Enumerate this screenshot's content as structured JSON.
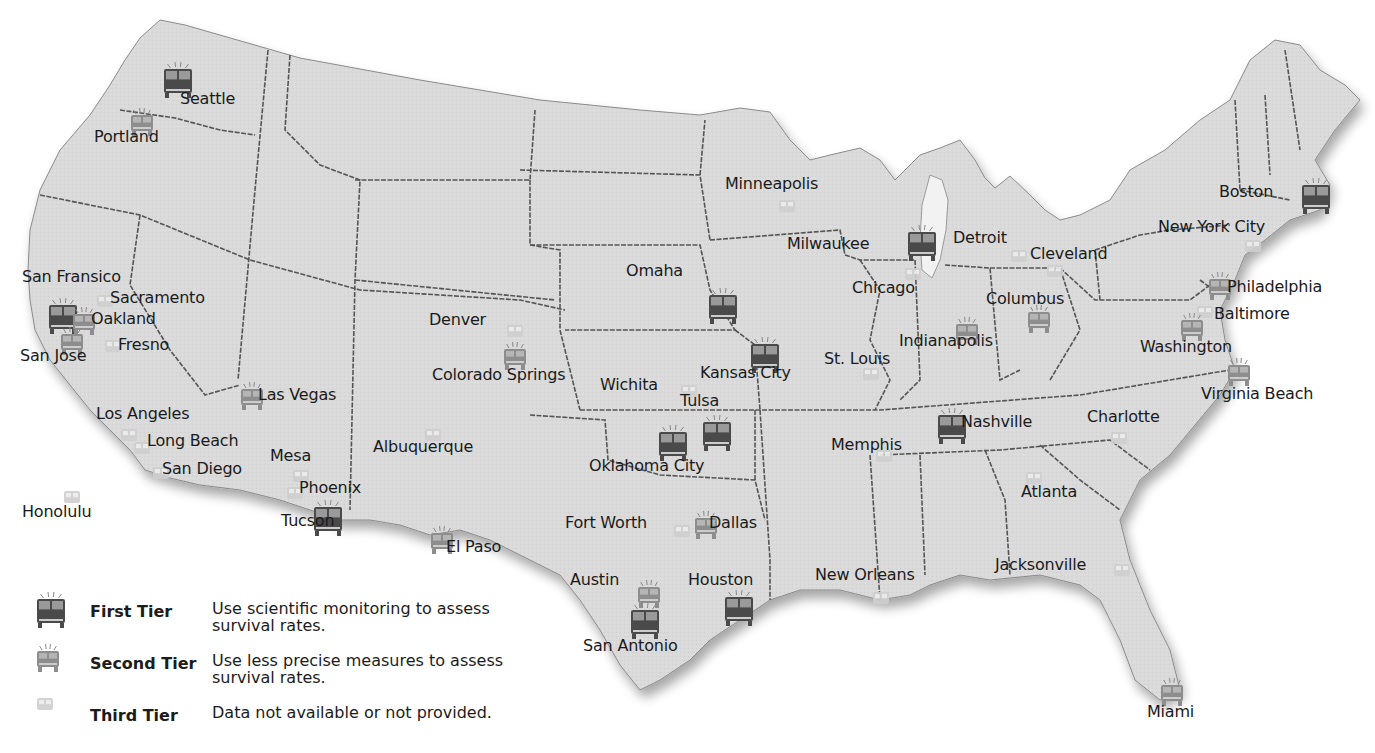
{
  "map": {
    "colors": {
      "background": "#ffffff",
      "land": "#d9d9d9",
      "border": "#5a5a5a",
      "tier1_icon": "#4a4a4a",
      "tier2_icon": "#8d8d8d",
      "tier3_icon": "#cfcfcf"
    },
    "cities": [
      {
        "name": "Seattle",
        "tier": 1,
        "x": 163,
        "y": 62,
        "lx": 180,
        "ly": 90
      },
      {
        "name": "Portland",
        "tier": 2,
        "x": 130,
        "y": 108,
        "lx": 94,
        "ly": 128
      },
      {
        "name": "San Fransico",
        "tier": 1,
        "x": 48,
        "y": 298,
        "lx": 22,
        "ly": 268
      },
      {
        "name": "Sacramento",
        "tier": 3,
        "x": 96,
        "y": 293,
        "lx": 110,
        "ly": 289
      },
      {
        "name": "Oakland",
        "tier": 2,
        "x": 72,
        "y": 307,
        "lx": 91,
        "ly": 310
      },
      {
        "name": "San Jose",
        "tier": 2,
        "x": 60,
        "y": 327,
        "lx": 20,
        "ly": 347
      },
      {
        "name": "Fresno",
        "tier": 3,
        "x": 104,
        "y": 338,
        "lx": 118,
        "ly": 336
      },
      {
        "name": "Los Angeles",
        "tier": 3,
        "x": 120,
        "y": 427,
        "lx": 96,
        "ly": 405
      },
      {
        "name": "Long Beach",
        "tier": 3,
        "x": 133,
        "y": 440,
        "lx": 147,
        "ly": 432
      },
      {
        "name": "San Diego",
        "tier": 3,
        "x": 152,
        "y": 465,
        "lx": 162,
        "ly": 460
      },
      {
        "name": "Honolulu",
        "tier": 3,
        "x": 63,
        "y": 489,
        "lx": 22,
        "ly": 503
      },
      {
        "name": "Las Vegas",
        "tier": 2,
        "x": 240,
        "y": 382,
        "lx": 258,
        "ly": 386
      },
      {
        "name": "Mesa",
        "tier": 3,
        "x": 292,
        "y": 468,
        "lx": 270,
        "ly": 447
      },
      {
        "name": "Phoenix",
        "tier": 3,
        "x": 286,
        "y": 485,
        "lx": 299,
        "ly": 479
      },
      {
        "name": "Tucson",
        "tier": 1,
        "x": 313,
        "y": 500,
        "lx": 281,
        "ly": 512
      },
      {
        "name": "Albuquerque",
        "tier": 3,
        "x": 424,
        "y": 427,
        "lx": 373,
        "ly": 438
      },
      {
        "name": "Denver",
        "tier": 3,
        "x": 506,
        "y": 323,
        "lx": 429,
        "ly": 311
      },
      {
        "name": "Colorado Springs",
        "tier": 2,
        "x": 503,
        "y": 342,
        "lx": 432,
        "ly": 366
      },
      {
        "name": "El Paso",
        "tier": 2,
        "x": 430,
        "y": 526,
        "lx": 446,
        "ly": 538
      },
      {
        "name": "Omaha",
        "tier": 1,
        "x": 708,
        "y": 288,
        "lx": 626,
        "ly": 262
      },
      {
        "name": "Kansas City",
        "tier": 1,
        "x": 750,
        "y": 337,
        "lx": 700,
        "ly": 364
      },
      {
        "name": "Wichita",
        "tier": 3,
        "x": 680,
        "y": 383,
        "lx": 600,
        "ly": 376
      },
      {
        "name": "Tulsa",
        "tier": 1,
        "x": 702,
        "y": 415,
        "lx": 680,
        "ly": 392
      },
      {
        "name": "Oklahoma City",
        "tier": 1,
        "x": 658,
        "y": 425,
        "lx": 589,
        "ly": 457
      },
      {
        "name": "Fort Worth",
        "tier": 3,
        "x": 673,
        "y": 523,
        "lx": 565,
        "ly": 514
      },
      {
        "name": "Dallas",
        "tier": 2,
        "x": 694,
        "y": 511,
        "lx": 709,
        "ly": 514
      },
      {
        "name": "Austin",
        "tier": 2,
        "x": 637,
        "y": 580,
        "lx": 570,
        "ly": 571
      },
      {
        "name": "San Antonio",
        "tier": 1,
        "x": 630,
        "y": 603,
        "lx": 583,
        "ly": 637
      },
      {
        "name": "Houston",
        "tier": 1,
        "x": 724,
        "y": 590,
        "lx": 688,
        "ly": 571
      },
      {
        "name": "Minneapolis",
        "tier": 3,
        "x": 778,
        "y": 198,
        "lx": 725,
        "ly": 175
      },
      {
        "name": "Milwaukee",
        "tier": 1,
        "x": 907,
        "y": 225,
        "lx": 787,
        "ly": 235
      },
      {
        "name": "Chicago",
        "tier": 3,
        "x": 904,
        "y": 266,
        "lx": 852,
        "ly": 279
      },
      {
        "name": "Detroit",
        "tier": 3,
        "x": 1010,
        "y": 248,
        "lx": 953,
        "ly": 229
      },
      {
        "name": "Cleveland",
        "tier": 3,
        "x": 1046,
        "y": 263,
        "lx": 1030,
        "ly": 245
      },
      {
        "name": "Columbus",
        "tier": 2,
        "x": 1027,
        "y": 305,
        "lx": 986,
        "ly": 290
      },
      {
        "name": "Indianapolis",
        "tier": 2,
        "x": 955,
        "y": 317,
        "lx": 899,
        "ly": 332
      },
      {
        "name": "St. Louis",
        "tier": 3,
        "x": 862,
        "y": 366,
        "lx": 824,
        "ly": 350
      },
      {
        "name": "Nashville",
        "tier": 1,
        "x": 937,
        "y": 408,
        "lx": 961,
        "ly": 413
      },
      {
        "name": "Memphis",
        "tier": 3,
        "x": 875,
        "y": 448,
        "lx": 831,
        "ly": 436
      },
      {
        "name": "Atlanta",
        "tier": 3,
        "x": 1025,
        "y": 470,
        "lx": 1021,
        "ly": 483
      },
      {
        "name": "Charlotte",
        "tier": 3,
        "x": 1110,
        "y": 430,
        "lx": 1087,
        "ly": 408
      },
      {
        "name": "New Orleans",
        "tier": 3,
        "x": 872,
        "y": 590,
        "lx": 815,
        "ly": 566
      },
      {
        "name": "Jacksonville",
        "tier": 3,
        "x": 1113,
        "y": 562,
        "lx": 995,
        "ly": 556
      },
      {
        "name": "Miami",
        "tier": 2,
        "x": 1160,
        "y": 678,
        "lx": 1147,
        "ly": 703
      },
      {
        "name": "Boston",
        "tier": 1,
        "x": 1301,
        "y": 178,
        "lx": 1219,
        "ly": 183
      },
      {
        "name": "New York City",
        "tier": 3,
        "x": 1244,
        "y": 238,
        "lx": 1158,
        "ly": 218
      },
      {
        "name": "Philadelphia",
        "tier": 2,
        "x": 1208,
        "y": 272,
        "lx": 1227,
        "ly": 278
      },
      {
        "name": "Baltimore",
        "tier": 3,
        "x": 1196,
        "y": 304,
        "lx": 1214,
        "ly": 305
      },
      {
        "name": "Washington",
        "tier": 2,
        "x": 1180,
        "y": 313,
        "lx": 1140,
        "ly": 338
      },
      {
        "name": "Virginia Beach",
        "tier": 2,
        "x": 1227,
        "y": 358,
        "lx": 1201,
        "ly": 385
      }
    ]
  },
  "legend": {
    "items": [
      {
        "tier": 1,
        "label": "First Tier",
        "description": "Use scientific monitoring to assess survival rates."
      },
      {
        "tier": 2,
        "label": "Second Tier",
        "description": "Use less precise measures to assess survival rates."
      },
      {
        "tier": 3,
        "label": "Third Tier",
        "description": "Data not available or not provided."
      }
    ]
  }
}
